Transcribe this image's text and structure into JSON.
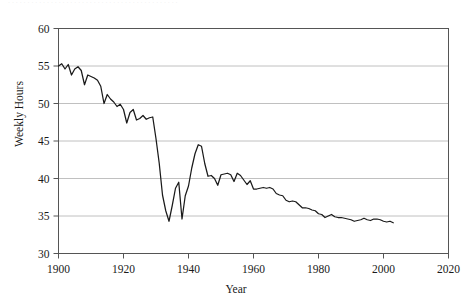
{
  "figure": {
    "caption_sliver": "· · · · · · · · · · · · · · · · · · · · · · · · · · · · · · · · · · · · · · · · · · · ·",
    "background_color": "#ffffff",
    "frame_color": "#555555",
    "grid_color": "#b9b9b9",
    "line_color": "#1a1a1a"
  },
  "chart_data": {
    "type": "line",
    "title": "",
    "xlabel": "Year",
    "ylabel": "Weekly Hours",
    "xlim": [
      1900,
      2020
    ],
    "ylim": [
      30,
      60
    ],
    "xticks": [
      1900,
      1920,
      1940,
      1960,
      1980,
      2000,
      2020
    ],
    "yticks": [
      30,
      35,
      40,
      45,
      50,
      55,
      60
    ],
    "grid": "horizontal",
    "legend": "none",
    "series": [
      {
        "name": "Weekly Hours",
        "x": [
          1900,
          1901,
          1902,
          1903,
          1904,
          1905,
          1906,
          1907,
          1908,
          1909,
          1910,
          1911,
          1912,
          1913,
          1914,
          1915,
          1916,
          1917,
          1918,
          1919,
          1920,
          1921,
          1922,
          1923,
          1924,
          1925,
          1926,
          1927,
          1928,
          1929,
          1930,
          1931,
          1932,
          1933,
          1934,
          1935,
          1936,
          1937,
          1938,
          1939,
          1940,
          1941,
          1942,
          1943,
          1944,
          1945,
          1946,
          1947,
          1948,
          1949,
          1950,
          1951,
          1952,
          1953,
          1954,
          1955,
          1956,
          1957,
          1958,
          1959,
          1960,
          1961,
          1962,
          1963,
          1964,
          1965,
          1966,
          1967,
          1968,
          1969,
          1970,
          1971,
          1972,
          1973,
          1974,
          1975,
          1976,
          1977,
          1978,
          1979,
          1980,
          1981,
          1982,
          1983,
          1984,
          1985,
          1986,
          1987,
          1988,
          1989,
          1990,
          1991,
          1992,
          1993,
          1994,
          1995,
          1996,
          1997,
          1998,
          1999,
          2000,
          2001,
          2002,
          2003
        ],
        "values": [
          55.0,
          55.3,
          54.6,
          55.2,
          53.8,
          54.6,
          54.9,
          54.4,
          52.5,
          53.8,
          53.6,
          53.4,
          53.1,
          52.3,
          50.0,
          51.2,
          50.6,
          50.2,
          49.6,
          49.9,
          49.2,
          47.4,
          48.8,
          49.2,
          47.8,
          48.0,
          48.4,
          47.9,
          48.1,
          48.2,
          45.3,
          42.0,
          37.8,
          35.7,
          34.3,
          36.4,
          38.7,
          39.5,
          34.6,
          37.7,
          39.0,
          41.4,
          43.3,
          44.5,
          44.3,
          42.0,
          40.3,
          40.4,
          40.0,
          39.1,
          40.5,
          40.6,
          40.7,
          40.5,
          39.6,
          40.7,
          40.4,
          39.8,
          39.2,
          39.7,
          38.6,
          38.6,
          38.7,
          38.8,
          38.7,
          38.8,
          38.6,
          38.0,
          37.8,
          37.7,
          37.1,
          36.9,
          37.0,
          36.9,
          36.5,
          36.1,
          36.1,
          36.0,
          35.8,
          35.7,
          35.3,
          35.2,
          34.8,
          35.0,
          35.2,
          34.9,
          34.8,
          34.8,
          34.7,
          34.6,
          34.5,
          34.3,
          34.4,
          34.5,
          34.7,
          34.5,
          34.4,
          34.6,
          34.6,
          34.5,
          34.3,
          34.2,
          34.3,
          34.1
        ]
      }
    ]
  }
}
